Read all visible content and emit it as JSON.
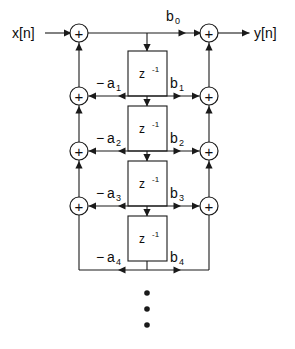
{
  "diagram": {
    "input_label": "x[n]",
    "output_label": "y[n]",
    "summer_symbol": "+",
    "delay_base": "z",
    "delay_exponent": "-1",
    "ellipsis_symbol": "•",
    "colors": {
      "line": "#1a1a1a",
      "text": "#0d0d0d",
      "background": "#ffffff",
      "node_fill": "#ffffff"
    },
    "feedforward_labels": [
      {
        "base": "b",
        "sub": "0"
      },
      {
        "base": "b",
        "sub": "1"
      },
      {
        "base": "b",
        "sub": "2"
      },
      {
        "base": "b",
        "sub": "3"
      },
      {
        "base": "b",
        "sub": "4"
      }
    ],
    "feedback_labels": [
      {
        "minus": "−",
        "base": "a",
        "sub": "1"
      },
      {
        "minus": "−",
        "base": "a",
        "sub": "2"
      },
      {
        "minus": "−",
        "base": "a",
        "sub": "3"
      },
      {
        "minus": "−",
        "base": "a",
        "sub": "4"
      }
    ],
    "delay_count": 4,
    "summer_rows": 4,
    "ellipsis_dots": 3
  }
}
